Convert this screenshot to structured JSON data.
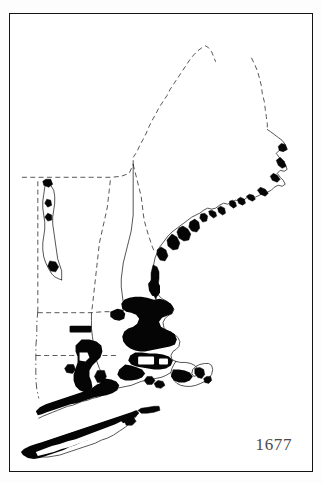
{
  "figure": {
    "kind": "historical-settlement-map",
    "region_title": "New England",
    "year_label": "1677",
    "frame": {
      "stroke_color": "#141414",
      "background_color": "#ffffff"
    },
    "legend_note": "",
    "colors": {
      "settled_area": "#050505",
      "coastline": "#1a1a1a",
      "political_border": "#2b2b2b",
      "page_background": "#fdfdfd",
      "year_text": "#4a4a4a"
    }
  },
  "map_elements": {
    "coastlines": [
      {
        "name": "maine-atlantic-coast"
      },
      {
        "name": "new-hampshire-massachusetts-coast"
      },
      {
        "name": "cape-cod-hook"
      },
      {
        "name": "long-island-sound-shore"
      },
      {
        "name": "long-island"
      },
      {
        "name": "lake-champlain"
      },
      {
        "name": "connecticut-river"
      },
      {
        "name": "merrimack-river"
      }
    ],
    "political_borders": [
      {
        "name": "maine-canada-border",
        "style": "dashed"
      },
      {
        "name": "vermont-quebec-border",
        "style": "dashed"
      },
      {
        "name": "vermont-new-hampshire-border",
        "style": "dashed"
      },
      {
        "name": "new-hampshire-maine-border",
        "style": "dashed"
      },
      {
        "name": "vermont-new-york-border",
        "style": "dashed"
      },
      {
        "name": "massachusetts-north-border",
        "style": "dashed"
      },
      {
        "name": "massachusetts-connecticut-border",
        "style": "dashed"
      },
      {
        "name": "connecticut-new-york-border",
        "style": "dashdot"
      }
    ],
    "settlement_areas": [
      {
        "name": "boston-massachusetts-bay-core"
      },
      {
        "name": "plymouth-colony"
      },
      {
        "name": "cape-cod-settlements"
      },
      {
        "name": "narragansett-rhode-island"
      },
      {
        "name": "connecticut-river-valley"
      },
      {
        "name": "new-haven-connecticut-coast"
      },
      {
        "name": "long-island-settlements"
      },
      {
        "name": "maine-coastal-outposts"
      },
      {
        "name": "new-hampshire-seacoast"
      },
      {
        "name": "lake-champlain-outposts"
      },
      {
        "name": "inland-massachusetts-town"
      }
    ]
  }
}
